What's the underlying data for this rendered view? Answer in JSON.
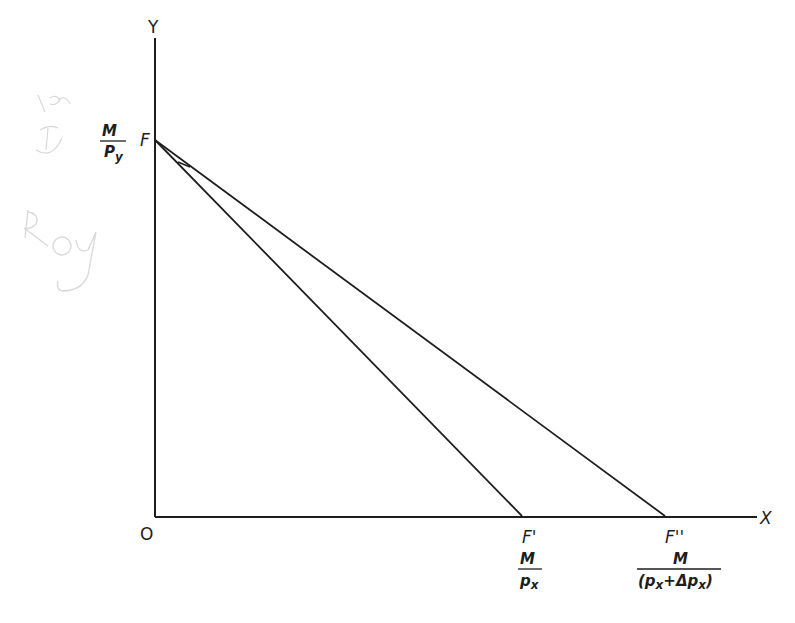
{
  "diagram": {
    "colors": {
      "ink": "#1e1e1e",
      "pencil": "#c8c8c8",
      "background": "#ffffff"
    },
    "axes": {
      "y_label": "Y",
      "x_label": "X",
      "origin_label": "O"
    },
    "points": {
      "F": {
        "label": "F",
        "value_num": "M",
        "value_den": "Py"
      },
      "F1": {
        "label": "F'",
        "value_num": "M",
        "value_den": "Px"
      },
      "F2": {
        "label": "F''",
        "value_num": "M",
        "value_den": "(Px+ΔPx)"
      }
    },
    "lines": [
      {
        "name": "FF'",
        "from": "F",
        "to": "F'"
      },
      {
        "name": "FF''",
        "from": "F",
        "to": "F''"
      }
    ],
    "annotations": {
      "handwriting_1": "ᶠᵉ",
      "handwriting_2": "Roy"
    }
  }
}
